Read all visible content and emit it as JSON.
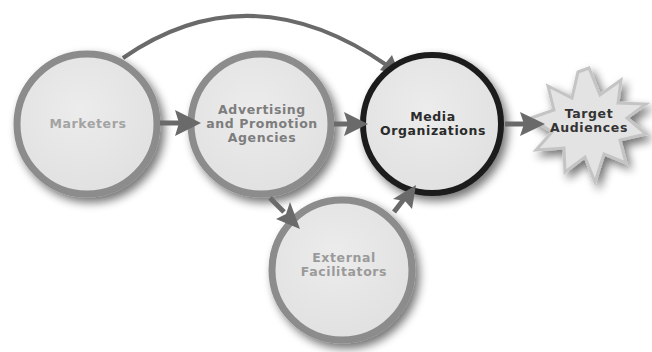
{
  "diagram": {
    "type": "flow",
    "nodes": [
      {
        "id": "marketers",
        "label": "Marketers",
        "shape": "circle",
        "cx": 87,
        "cy": 124,
        "r": 70,
        "stroke": "#8c8c8c",
        "text_color": "#a3a3a3"
      },
      {
        "id": "agencies",
        "label": "Advertising\nand Promotion\nAgencies",
        "shape": "circle",
        "cx": 261,
        "cy": 124,
        "r": 70,
        "stroke": "#8c8c8c",
        "text_color": "#7d7d7d"
      },
      {
        "id": "media",
        "label": "Media\nOrganizations",
        "shape": "circle",
        "cx": 432,
        "cy": 124,
        "r": 69,
        "stroke": "#1e1e1e",
        "text_color": "#2b2b2b"
      },
      {
        "id": "target",
        "label": "Target\nAudiences",
        "shape": "starburst",
        "cx": 589,
        "cy": 126,
        "r": 58,
        "stroke": "#c4c4c4",
        "text_color": "#333333"
      },
      {
        "id": "external",
        "label": "External\nFacilitators",
        "shape": "circle",
        "cx": 342,
        "cy": 270,
        "r": 70,
        "stroke": "#8c8c8c",
        "text_color": "#9a9a9a"
      }
    ],
    "edges": [
      {
        "from": "marketers",
        "to": "agencies"
      },
      {
        "from": "marketers",
        "to": "media",
        "curved": true
      },
      {
        "from": "agencies",
        "to": "media"
      },
      {
        "from": "agencies",
        "to": "external"
      },
      {
        "from": "external",
        "to": "media"
      },
      {
        "from": "media",
        "to": "target"
      }
    ],
    "colors": {
      "node_fill": "#e6e6e6",
      "arrow": "#6a6a6a",
      "background": "#ffffff"
    }
  }
}
